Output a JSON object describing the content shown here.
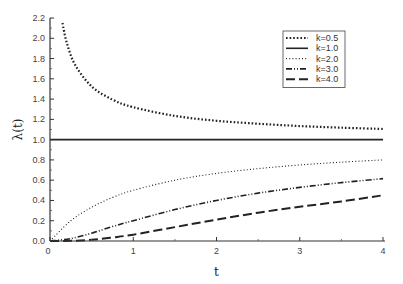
{
  "chart_data": {
    "type": "line",
    "title": "",
    "xlabel": "t",
    "ylabel": "λ(t)",
    "xlim": [
      0,
      4
    ],
    "ylim": [
      0,
      2.2
    ],
    "x_ticks": [
      "0",
      "1",
      "2",
      "3",
      "4"
    ],
    "x_tick_values": [
      0,
      1,
      2,
      3,
      4
    ],
    "y_ticks": [
      "0.0",
      "0.2",
      "0.4",
      "0.6",
      "0.8",
      "1.0",
      "1.2",
      "1.4",
      "1.6",
      "1.8",
      "2.0",
      "2.2"
    ],
    "y_tick_values": [
      0,
      0.2,
      0.4,
      0.6,
      0.8,
      1.0,
      1.2,
      1.4,
      1.6,
      1.8,
      2.0,
      2.2
    ],
    "grid": false,
    "legend_position": "top-right",
    "series": [
      {
        "name": "k=0.5",
        "style": "dotted-heavy",
        "x": [
          0.15,
          0.2,
          0.3,
          0.5,
          0.75,
          1.0,
          1.5,
          2.0,
          2.5,
          3.0,
          3.5,
          4.0
        ],
        "y": [
          2.15,
          1.96,
          1.74,
          1.525,
          1.395,
          1.32,
          1.234,
          1.186,
          1.157,
          1.134,
          1.118,
          1.105
        ]
      },
      {
        "name": "k=1.0",
        "style": "solid",
        "x": [
          0,
          4
        ],
        "y": [
          1.0,
          1.0
        ]
      },
      {
        "name": "k=2.0",
        "style": "dotted-fine",
        "x": [
          0,
          0.25,
          0.5,
          0.75,
          1.0,
          1.5,
          2.0,
          2.5,
          3.0,
          3.5,
          4.0
        ],
        "y": [
          0,
          0.2,
          0.333,
          0.429,
          0.5,
          0.6,
          0.667,
          0.714,
          0.75,
          0.778,
          0.8
        ]
      },
      {
        "name": "k=3.0",
        "style": "dash-dot-dot",
        "x": [
          0,
          0.25,
          0.5,
          0.75,
          1.0,
          1.5,
          2.0,
          2.5,
          3.0,
          3.5,
          4.0
        ],
        "y": [
          0,
          0.024,
          0.077,
          0.143,
          0.2,
          0.31,
          0.4,
          0.472,
          0.529,
          0.576,
          0.615
        ]
      },
      {
        "name": "k=4.0",
        "style": "long-dash",
        "x": [
          0,
          0.25,
          0.5,
          0.75,
          1.0,
          1.5,
          2.0,
          2.5,
          3.0,
          3.5,
          4.0
        ],
        "y": [
          0,
          0.002,
          0.012,
          0.035,
          0.0625,
          0.137,
          0.211,
          0.279,
          0.338,
          0.39,
          0.451
        ]
      }
    ]
  }
}
